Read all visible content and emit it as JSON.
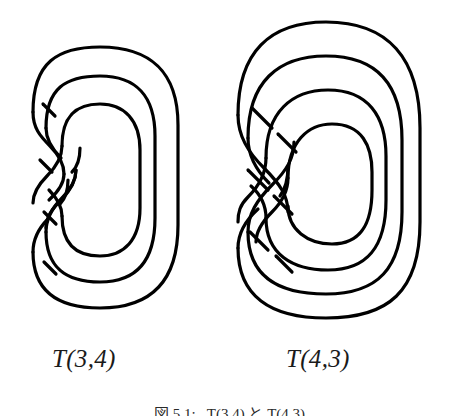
{
  "figure": {
    "background_color": "#ffffff",
    "stroke_color": "#000000",
    "stroke_width": 3,
    "panels": [
      {
        "id": "left",
        "label": "T(3,4)",
        "knot_type": "torus-knot-diagram",
        "strands": 3,
        "twists": 4,
        "crossings": 8,
        "label_x": 52,
        "label_y": 345
      },
      {
        "id": "right",
        "label": "T(4,3)",
        "knot_type": "torus-knot-diagram",
        "strands": 4,
        "twists": 3,
        "crossings": 9,
        "label_x": 286,
        "label_y": 345
      }
    ]
  },
  "caption": {
    "text": "図 5.1:   T(3,4) と T(4,3)"
  }
}
